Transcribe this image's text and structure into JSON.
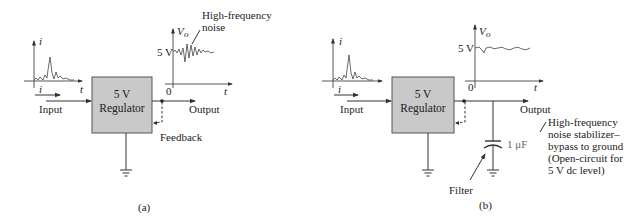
{
  "panels": [
    {
      "id": "a",
      "caption": "(a)",
      "block": {
        "line1": "5 V",
        "line2": "Regulator"
      },
      "input_label": "Input",
      "output_label": "Output",
      "feedback_label": "Feedback",
      "input_plot": {
        "y_label": "i",
        "x_label": "t",
        "current_label": "i"
      },
      "output_plot": {
        "y_label": "V",
        "y_sub": "o",
        "level_label": "5 V",
        "origin_label": "0",
        "x_label": "t"
      },
      "annotation": {
        "line1": "High-frequency",
        "line2": "noise"
      }
    },
    {
      "id": "b",
      "caption": "(b)",
      "block": {
        "line1": "5 V",
        "line2": "Regulator"
      },
      "input_label": "Input",
      "output_label": "Output",
      "input_plot": {
        "y_label": "i",
        "x_label": "t",
        "current_label": "i"
      },
      "output_plot": {
        "y_label": "V",
        "y_sub": "o",
        "level_label": "5 V",
        "origin_label": "0",
        "x_label": "t"
      },
      "capacitor_label": "1 μF",
      "filter_label": "Filter",
      "annotation": {
        "line1": "High-frequency",
        "line2": "noise stabilizer–",
        "line3": "bypass to ground",
        "line4": "(Open-circuit for",
        "line5": "5 V dc level)"
      }
    }
  ],
  "colors": {
    "block_fill": "#c9c9c9",
    "line": "#333333",
    "text": "#222222"
  }
}
